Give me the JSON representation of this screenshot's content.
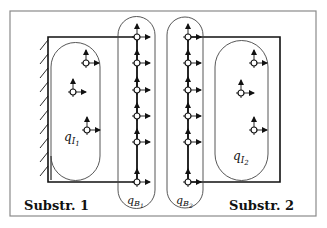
{
  "diagram": {
    "type": "substructuring-schematic",
    "substructures": [
      {
        "label": "Substr. 1",
        "interior_label": "q",
        "interior_sub": "I",
        "interior_subsub": "1",
        "boundary_label": "q",
        "boundary_sub": "B",
        "boundary_subsub": "1"
      },
      {
        "label": "Substr. 2",
        "interior_label": "q",
        "interior_sub": "I",
        "interior_subsub": "2",
        "boundary_label": "q",
        "boundary_sub": "B",
        "boundary_subsub": "2"
      }
    ],
    "colors": {
      "frame": "#8a8a8a",
      "line": "#1a1a1a",
      "background": "#ffffff"
    }
  }
}
